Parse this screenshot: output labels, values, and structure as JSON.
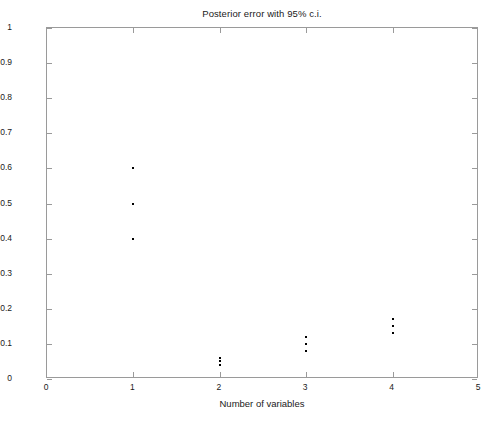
{
  "chart_data": {
    "type": "scatter",
    "title": "Posterior error with 95% c.i.",
    "xlabel": "Number of variables",
    "ylabel": "Error",
    "xlim": [
      0,
      5
    ],
    "ylim": [
      0,
      1
    ],
    "xticks": [
      "0",
      "1",
      "2",
      "3",
      "4",
      "5"
    ],
    "xtick_values": [
      0,
      1,
      2,
      3,
      4,
      5
    ],
    "yticks": [
      "0",
      "0.1",
      "0.2",
      "0.3",
      "0.4",
      "0.5",
      "0.6",
      "0.7",
      "0.8",
      "0.9",
      "1"
    ],
    "ytick_values": [
      0,
      0.1,
      0.2,
      0.3,
      0.4,
      0.5,
      0.6,
      0.7,
      0.8,
      0.9,
      1
    ],
    "grid": false,
    "legend": false,
    "marker": "dot",
    "marker_color": "#000000",
    "series": [
      {
        "name": "lower 95% c.i.",
        "x": [
          1,
          2,
          3,
          4
        ],
        "values": [
          0.4,
          0.04,
          0.08,
          0.13
        ]
      },
      {
        "name": "posterior error",
        "x": [
          1,
          2,
          3,
          4
        ],
        "values": [
          0.5,
          0.05,
          0.1,
          0.15
        ]
      },
      {
        "name": "upper 95% c.i.",
        "x": [
          1,
          2,
          3,
          4
        ],
        "values": [
          0.6,
          0.06,
          0.12,
          0.17
        ]
      }
    ],
    "points": [
      {
        "x": 1,
        "y": 0.6
      },
      {
        "x": 1,
        "y": 0.5
      },
      {
        "x": 1,
        "y": 0.4
      },
      {
        "x": 2,
        "y": 0.06
      },
      {
        "x": 2,
        "y": 0.05
      },
      {
        "x": 2,
        "y": 0.04
      },
      {
        "x": 3,
        "y": 0.12
      },
      {
        "x": 3,
        "y": 0.1
      },
      {
        "x": 3,
        "y": 0.08
      },
      {
        "x": 4,
        "y": 0.17
      },
      {
        "x": 4,
        "y": 0.15
      },
      {
        "x": 4,
        "y": 0.13
      }
    ]
  }
}
